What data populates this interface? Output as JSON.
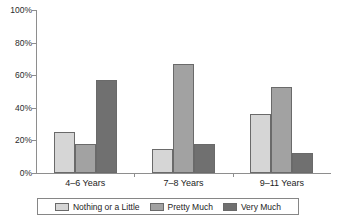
{
  "chart_data": {
    "type": "bar",
    "title": "",
    "xlabel": "",
    "ylabel": "",
    "ylim": [
      0,
      100
    ],
    "grid": false,
    "legend_position": "bottom",
    "y_ticks": [
      "0%",
      "20%",
      "40%",
      "60%",
      "80%",
      "100%"
    ],
    "y_tick_values": [
      0,
      20,
      40,
      60,
      80,
      100
    ],
    "categories": [
      "4–6 Years",
      "7–8 Years",
      "9–11 Years"
    ],
    "series": [
      {
        "name": "Nothing or a Little",
        "color": "#d6d6d6",
        "values": [
          25,
          15,
          36
        ]
      },
      {
        "name": "Pretty Much",
        "color": "#a2a2a2",
        "values": [
          18,
          67,
          53
        ]
      },
      {
        "name": "Very Much",
        "color": "#707070",
        "values": [
          57,
          18,
          12
        ]
      }
    ]
  },
  "axis": {
    "line_color": "#8e8e8e",
    "tick_color": "#8e8e8e"
  },
  "legend": {
    "border_color": "#868686",
    "background": "#ffffff"
  }
}
